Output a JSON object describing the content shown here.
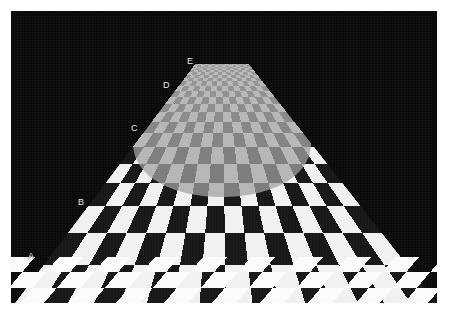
{
  "figure": {
    "border_color": "#ffffff",
    "background_color": "#090909",
    "label_color": "#eceaea"
  },
  "geometry": {
    "panel": {
      "x": 11,
      "y": 11,
      "width": 426,
      "height": 292
    },
    "vanishing_point": {
      "x": 222,
      "y": 63
    },
    "horizon_y": 63,
    "top_edge": {
      "x_left": 196,
      "x_right": 248,
      "y": 63
    },
    "bottom_edge": {
      "x_left": 15,
      "x_right": 437,
      "y": 303
    },
    "near_band_top_y": 240,
    "contrast_arc": {
      "center_x": 222,
      "center_y": 130,
      "radius_x": 150,
      "radius_y": 72
    }
  },
  "labels": [
    {
      "id": "A",
      "text": "A",
      "x": 28,
      "y": 252,
      "depth_zone": "near"
    },
    {
      "id": "B",
      "text": "B",
      "x": 78,
      "y": 198,
      "depth_zone": "mid-near"
    },
    {
      "id": "C",
      "text": "C",
      "x": 131,
      "y": 124,
      "depth_zone": "mid-far"
    },
    {
      "id": "D",
      "text": "D",
      "x": 163,
      "y": 81,
      "depth_zone": "far"
    },
    {
      "id": "E",
      "text": "E",
      "x": 187,
      "y": 57,
      "depth_zone": "horizon"
    }
  ],
  "checker": {
    "columns": 16,
    "rows_far_gray": 11,
    "rows_near_high_contrast": 8,
    "rows_bottom_fine": 3,
    "near_light": "#f1f1f1",
    "near_dark": "#161616",
    "far_light": "#b6b6b6",
    "far_dark": "#7c7c7c",
    "horizon_light": "#b9b9b9",
    "horizon_dark": "#9a9a9a",
    "bottom_light": "#fbfbfb",
    "bottom_dark": "#0d0d0d"
  },
  "chart_data": {
    "type": "heatmap",
    "xlabel": "",
    "ylabel": "",
    "legend": [
      "A",
      "B",
      "C",
      "D",
      "E"
    ],
    "annotations": [
      "A",
      "B",
      "C",
      "D",
      "E"
    ],
    "categories": [
      "A",
      "B",
      "C",
      "D",
      "E"
    ],
    "values": [
      1.0,
      1.0,
      0.28,
      0.18,
      0.11
    ],
    "series": [
      {
        "name": "checker_contrast",
        "values": [
          1.0,
          1.0,
          0.28,
          0.18,
          0.11
        ]
      },
      {
        "name": "row_screen_y",
        "values": [
          295,
          215,
          140,
          92,
          66
        ]
      },
      {
        "name": "cell_screen_width",
        "values": [
          44,
          26,
          12,
          7,
          4
        ]
      }
    ],
    "grid": false,
    "legend_position": "left-edge-inline"
  }
}
